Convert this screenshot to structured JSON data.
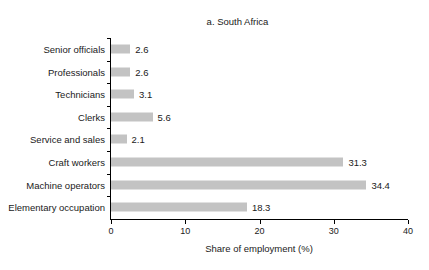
{
  "page_heading": "South Africa and Zambia",
  "panel_title": "a. South Africa",
  "colors": {
    "bar_fill": "#c3c3c3",
    "axis": "#000000",
    "text": "#1a1a1a"
  },
  "chart_data": {
    "type": "bar",
    "orientation": "horizontal",
    "title": "a. South Africa",
    "xlabel": "Share of employment (%)",
    "ylabel": "",
    "xlim": [
      0,
      40
    ],
    "xticks": [
      "0",
      "10",
      "20",
      "30",
      "40"
    ],
    "grid": false,
    "legend": false,
    "categories": [
      "Senior officials",
      "Professionals",
      "Technicians",
      "Clerks",
      "Service and sales",
      "Craft workers",
      "Machine operators",
      "Elementary occupation"
    ],
    "values": [
      2.6,
      2.6,
      3.1,
      5.6,
      2.1,
      31.3,
      34.4,
      18.3
    ],
    "value_labels": [
      "2.6",
      "2.6",
      "3.1",
      "5.6",
      "2.1",
      "31.3",
      "34.4",
      "18.3"
    ]
  }
}
